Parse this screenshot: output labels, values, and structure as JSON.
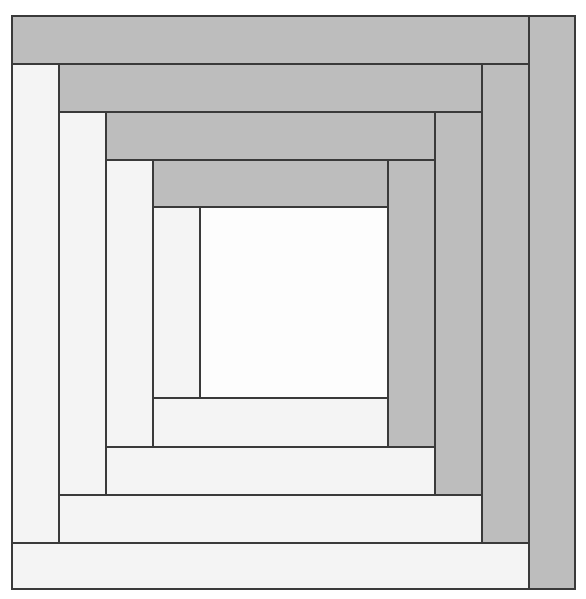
{
  "diagram": {
    "colors": {
      "dark": "#bdbdbd",
      "light": "#f4f4f4",
      "center": "#fdfdfd",
      "seam": "#3a3a3a"
    },
    "pieces": [
      {
        "id": "center",
        "tone": "center",
        "x": 188,
        "y": 191,
        "w": 190,
        "h": 193
      },
      {
        "id": "r1-light-left",
        "tone": "light",
        "x": 141,
        "y": 191,
        "w": 49,
        "h": 193
      },
      {
        "id": "r1-dark-top",
        "tone": "dark",
        "x": 141,
        "y": 144,
        "w": 237,
        "h": 49
      },
      {
        "id": "r1-dark-right",
        "tone": "dark",
        "x": 376,
        "y": 144,
        "w": 49,
        "h": 289
      },
      {
        "id": "r1-light-bottom",
        "tone": "light",
        "x": 141,
        "y": 382,
        "w": 237,
        "h": 51
      },
      {
        "id": "r2-light-left",
        "tone": "light",
        "x": 94,
        "y": 144,
        "w": 49,
        "h": 289
      },
      {
        "id": "r2-dark-top",
        "tone": "dark",
        "x": 94,
        "y": 96,
        "w": 331,
        "h": 50
      },
      {
        "id": "r2-dark-right",
        "tone": "dark",
        "x": 423,
        "y": 96,
        "w": 49,
        "h": 385
      },
      {
        "id": "r2-light-bottom",
        "tone": "light",
        "x": 94,
        "y": 431,
        "w": 331,
        "h": 50
      },
      {
        "id": "r3-light-left",
        "tone": "light",
        "x": 47,
        "y": 96,
        "w": 49,
        "h": 385
      },
      {
        "id": "r3-dark-top",
        "tone": "dark",
        "x": 47,
        "y": 48,
        "w": 425,
        "h": 50
      },
      {
        "id": "r3-dark-right",
        "tone": "dark",
        "x": 470,
        "y": 48,
        "w": 49,
        "h": 481
      },
      {
        "id": "r3-light-bottom",
        "tone": "light",
        "x": 47,
        "y": 479,
        "w": 425,
        "h": 50
      },
      {
        "id": "r4-light-left",
        "tone": "light",
        "x": 0,
        "y": 48,
        "w": 49,
        "h": 481
      },
      {
        "id": "r4-dark-top",
        "tone": "dark",
        "x": 0,
        "y": 0,
        "w": 519,
        "h": 50
      },
      {
        "id": "r4-dark-right",
        "tone": "dark",
        "x": 517,
        "y": 0,
        "w": 48,
        "h": 575
      },
      {
        "id": "r4-light-bottom",
        "tone": "light",
        "x": 0,
        "y": 527,
        "w": 519,
        "h": 48
      }
    ]
  }
}
